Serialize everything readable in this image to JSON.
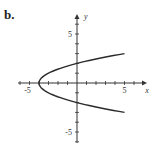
{
  "figure": {
    "panel_label": "b."
  },
  "chart_data": {
    "type": "line",
    "title": "",
    "xlabel": "x",
    "ylabel": "y",
    "xlim": [
      -6,
      7
    ],
    "ylim": [
      -6,
      7
    ],
    "x_tick_labels": [
      "-5",
      "5"
    ],
    "y_tick_labels": [
      "5",
      "-5"
    ],
    "grid": false,
    "series": [
      {
        "name": "x = y^2 - 4",
        "x": [
          5,
          2.25,
          0,
          -1.75,
          -3,
          -3.75,
          -4,
          -3.75,
          -3,
          -1.75,
          0,
          2.25,
          5
        ],
        "y": [
          3,
          2.5,
          2,
          1.5,
          1,
          0.5,
          0,
          -0.5,
          -1,
          -1.5,
          -2,
          -2.5,
          -3
        ]
      }
    ]
  },
  "colors": {
    "axis": "#333333",
    "curve": "#2a2a2a"
  }
}
